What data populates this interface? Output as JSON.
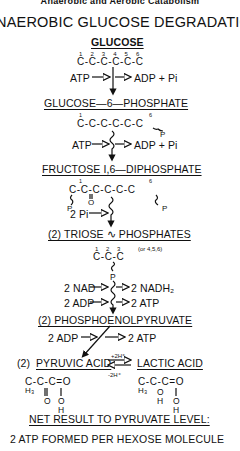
{
  "header": "Anaerobic and Aerobic Catabolism",
  "title": "NAEROBIC GLUCOSE DEGRADATION",
  "steps": {
    "glucose": {
      "label": "GLUCOSE",
      "numbers": "1  2  3  4  5  6",
      "chain": "C-C-C-C-C-C"
    },
    "step1": {
      "input": "ATP",
      "output": "ADP + Pi"
    },
    "g6p": {
      "label": "GLUCOSE—6—PHOSPHATE",
      "num1": "1",
      "num6": "6",
      "chain": "C-C-C-C-C-C",
      "p": "P"
    },
    "step2": {
      "input": "ATP",
      "output": "ADP + Pi"
    },
    "f16dp": {
      "label": "FRUCTOSE I,6—DIPHOSPHATE",
      "num1": "1",
      "num6": "6",
      "chain": "C-C-C-C-C-C",
      "o": "O",
      "p_left": "P",
      "p_right": "P"
    },
    "step3": {
      "input": "2 Pi"
    },
    "triose": {
      "label": "(2) TRIOSE ∿ PHOSPHATES",
      "numbers": "1  2  3",
      "note": "(or 4,5,6)",
      "chain": "C-C-C",
      "p": "P"
    },
    "step4": {
      "input1": "2 NAD",
      "output1": "2 NADH₂",
      "input2": "2 ADP",
      "output2": "2 ATP"
    },
    "pep": {
      "label": "(2) PHOSPHOENOLPYRUVATE"
    },
    "step5": {
      "input": "2 ADP",
      "output": "2 ATP"
    },
    "pyruvic": {
      "prefix": "(2)",
      "label": "PYRUVIC ACID",
      "line1": "C-C-C=O",
      "h3": "H₃",
      "o": "O",
      "oh_o": "O",
      "oh_h": "H"
    },
    "equilibrium": {
      "forward": "+2H⁺",
      "reverse": "-2H⁺"
    },
    "lactic": {
      "label": "LACTIC ACID",
      "line1": "C-C-C=O",
      "h3": "H₃",
      "o_mid": "O",
      "h_mid": "H",
      "oh_o": "O",
      "oh_h": "H"
    }
  },
  "footer": {
    "net_label": "NET RESULT TO PYRUVATE LEVEL:",
    "result": "2 ATP FORMED PER HEXOSE MOLECULE"
  },
  "colors": {
    "ink": "#111111",
    "background": "#ffffff"
  }
}
